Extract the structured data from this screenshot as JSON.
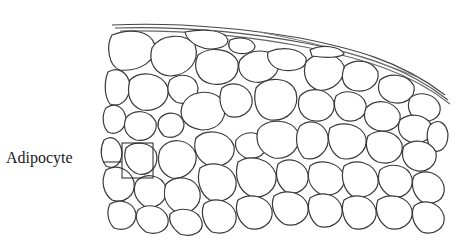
{
  "figure": {
    "label": "Adipocyte",
    "colors": {
      "ink": "#2a2a2a",
      "background": "#ffffff",
      "line": "#333333"
    }
  }
}
